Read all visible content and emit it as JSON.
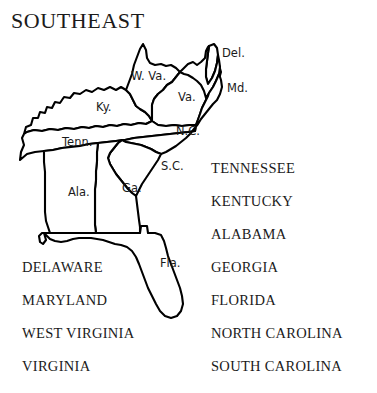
{
  "map": {
    "title": "SOUTHEAST",
    "region_labels": [
      {
        "name": "west-virginia",
        "text": "W. Va.",
        "x": 131,
        "y": 50
      },
      {
        "name": "delaware",
        "text": "Del.",
        "x": 222,
        "y": 27
      },
      {
        "name": "maryland",
        "text": "Md.",
        "x": 227,
        "y": 62
      },
      {
        "name": "virginia",
        "text": "Va.",
        "x": 178,
        "y": 71
      },
      {
        "name": "kentucky",
        "text": "Ky.",
        "x": 96,
        "y": 81
      },
      {
        "name": "tennessee",
        "text": "Tenn.",
        "x": 62,
        "y": 116
      },
      {
        "name": "north-carolina",
        "text": "N.C.",
        "x": 176,
        "y": 105
      },
      {
        "name": "south-carolina",
        "text": "S.C.",
        "x": 161,
        "y": 140
      },
      {
        "name": "alabama",
        "text": "Ala.",
        "x": 68,
        "y": 166
      },
      {
        "name": "georgia",
        "text": "Ga.",
        "x": 122,
        "y": 162
      },
      {
        "name": "florida",
        "text": "Fla.",
        "x": 160,
        "y": 237
      }
    ]
  },
  "legend_left": {
    "items": [
      "DELAWARE",
      "MARYLAND",
      "WEST VIRGINIA",
      "VIRGINIA"
    ]
  },
  "legend_right": {
    "items": [
      "TENNESSEE",
      "KENTUCKY",
      "ALABAMA",
      "GEORGIA",
      "FLORIDA",
      "NORTH CAROLINA",
      "SOUTH CAROLINA"
    ]
  },
  "colors": {
    "background": "#ffffff",
    "ink": "#1b1b1b",
    "outline": "#000000"
  }
}
